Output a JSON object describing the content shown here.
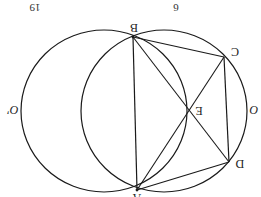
{
  "diagram": {
    "orientation": "rotated 180 degrees",
    "stroke_color": "#1a1a1a",
    "background": "#ffffff",
    "header_fragments": [
      {
        "text": "19",
        "x": 35,
        "y": 7
      },
      {
        "text": "6",
        "x": 176,
        "y": 7
      }
    ],
    "circles": [
      {
        "name": "O",
        "cx": 164,
        "cy": 111,
        "rx": 83,
        "ry": 81
      },
      {
        "name": "O'",
        "cx": 104,
        "cy": 111,
        "rx": 83,
        "ry": 81
      }
    ],
    "points": {
      "A": {
        "label": "A",
        "x": 137,
        "y": 190
      },
      "B": {
        "label": "B",
        "x": 133,
        "y": 37
      },
      "C": {
        "label": "C",
        "x": 224,
        "y": 57
      },
      "D": {
        "label": "D",
        "x": 229,
        "y": 162
      },
      "E": {
        "label": "E",
        "x": 188,
        "y": 110
      }
    },
    "segments": [
      [
        "A",
        "B"
      ],
      [
        "B",
        "C"
      ],
      [
        "C",
        "D"
      ],
      [
        "D",
        "A"
      ],
      [
        "B",
        "D"
      ],
      [
        "A",
        "C"
      ]
    ],
    "circle_labels": [
      {
        "text": "O'",
        "x": 14,
        "y": 108
      },
      {
        "text": "O",
        "x": 252,
        "y": 108
      }
    ]
  }
}
